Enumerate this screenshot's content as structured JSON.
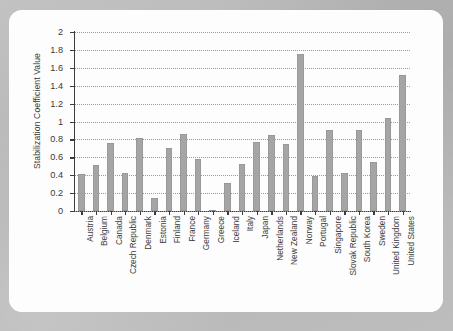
{
  "chart_data": {
    "type": "bar",
    "title": "",
    "xlabel": "",
    "ylabel": "Stabilization Coefficient Value",
    "ylim": [
      0,
      2
    ],
    "ytick_labels": [
      "2",
      "1.8",
      "1.6",
      "1.4",
      "1.2",
      "1",
      "0.8",
      "0.6",
      "0.4",
      "0.2",
      "0"
    ],
    "ytick_values": [
      2,
      1.8,
      1.6,
      1.4,
      1.2,
      1,
      0.8,
      0.6,
      0.4,
      0.2,
      0
    ],
    "grid": true,
    "grid_style": "dotted-horizontal",
    "legend": "none",
    "bar_color": "#a5a5a5",
    "axis_color": "#3c3c3c",
    "categories": [
      "Austria",
      "Belgium",
      "Canada",
      "Czech Republic",
      "Denmark",
      "Estonia",
      "Finland",
      "France",
      "Germany",
      "Greece",
      "Iceland",
      "Italy",
      "Japan",
      "Netherlands",
      "New Zealand",
      "Norway",
      "Portugal",
      "Singapore",
      "Slovak Republic",
      "South Korea",
      "Sweden",
      "United Kingdom",
      "United States"
    ],
    "values": [
      0.41,
      0.51,
      0.76,
      0.42,
      0.82,
      0.14,
      0.7,
      0.86,
      0.58,
      0.01,
      0.31,
      0.53,
      0.77,
      0.85,
      0.75,
      1.75,
      0.39,
      0.9,
      0.42,
      0.9,
      0.55,
      1.04,
      1.52
    ]
  },
  "colors": {
    "page_background": "#bdbdbd",
    "card_background": "#fdfdfd",
    "bar": "#a5a5a5",
    "axis": "#3c3c3c",
    "gridline": "#9a9a9a",
    "text": "#3a3a3a"
  }
}
